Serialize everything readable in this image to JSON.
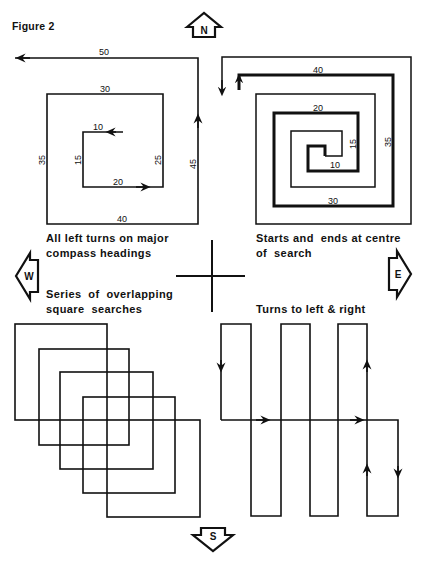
{
  "figure": {
    "title": "Figure 2"
  },
  "compass": {
    "north": "N",
    "south": "S",
    "east": "E",
    "west": "W"
  },
  "panels": {
    "expanding_square": {
      "caption_line1": "All left turns on major",
      "caption_line2": "compass headings",
      "legs": [
        "10",
        "15",
        "20",
        "25",
        "30",
        "35",
        "40",
        "45",
        "50"
      ]
    },
    "spiral_square": {
      "caption_line1": "Starts and  ends at centre",
      "caption_line2": "of  search",
      "legs": [
        "10",
        "15",
        "20",
        "30",
        "35",
        "40"
      ]
    },
    "overlapping_squares": {
      "caption_line1": "Series  of  overlapping",
      "caption_line2": "square  searches",
      "square_count": 5
    },
    "creeping_line": {
      "caption_line1": "Turns to left & right"
    }
  },
  "colors": {
    "ink": "#111111",
    "paper": "#ffffff"
  }
}
